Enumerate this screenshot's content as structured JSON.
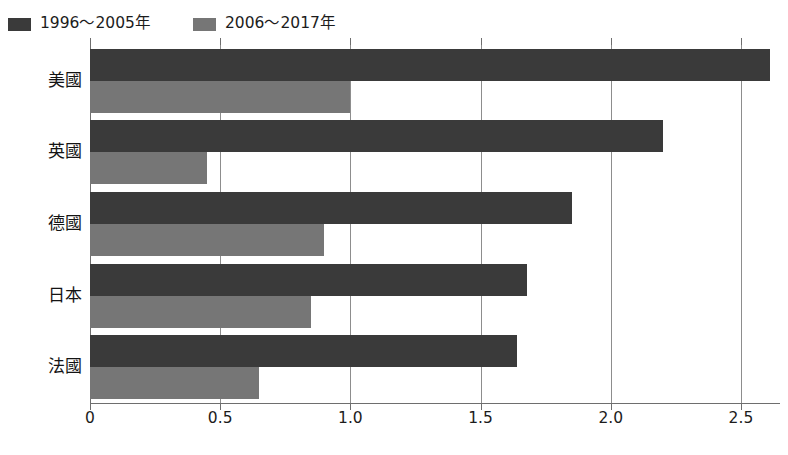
{
  "chart_data": {
    "type": "bar",
    "orientation": "horizontal",
    "title": "",
    "subtitle": "",
    "xlabel": "",
    "ylabel": "",
    "categories": [
      "美國",
      "英國",
      "德國",
      "日本",
      "法國"
    ],
    "series": [
      {
        "name": "1996～2005年",
        "color": "#3a3a3a",
        "values": [
          2.61,
          2.2,
          1.85,
          1.68,
          1.64
        ]
      },
      {
        "name": "2006～2017年",
        "color": "#767676",
        "values": [
          1.0,
          0.45,
          0.9,
          0.85,
          0.65
        ]
      }
    ],
    "xlim": [
      0,
      2.65
    ],
    "xticks": [
      0,
      0.5,
      1.0,
      1.5,
      2.0,
      2.5
    ],
    "xtick_labels": [
      "0",
      "0.5",
      "1.0",
      "1.5",
      "2.0",
      "2.5"
    ],
    "grid": true,
    "grid_axis": "x",
    "legend_position": "top-left",
    "frame_color": "#6e6e6e",
    "gridline_color": "#8d8d8d",
    "background": "#ffffff"
  }
}
